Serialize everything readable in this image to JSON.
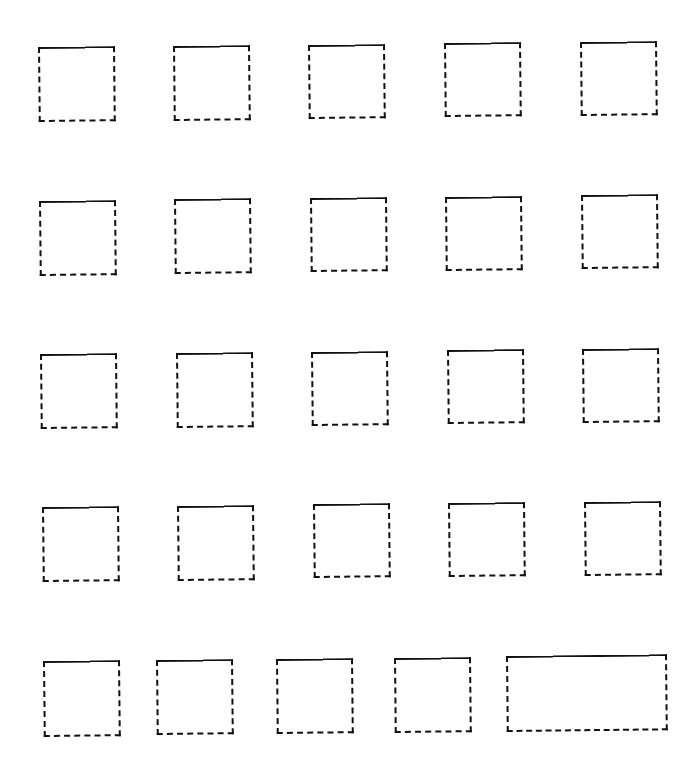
{
  "page": {
    "background": "#ffffff",
    "line_color": "#111111"
  },
  "boxes": [
    {
      "row": 1,
      "col": 1,
      "x": 38,
      "y": 47,
      "w": 77,
      "h": 75
    },
    {
      "row": 1,
      "col": 2,
      "x": 173,
      "y": 46,
      "w": 77,
      "h": 75
    },
    {
      "row": 1,
      "col": 3,
      "x": 308,
      "y": 45,
      "w": 77,
      "h": 74
    },
    {
      "row": 1,
      "col": 4,
      "x": 444,
      "y": 43,
      "w": 77,
      "h": 74
    },
    {
      "row": 1,
      "col": 5,
      "x": 580,
      "y": 42,
      "w": 77,
      "h": 74
    },
    {
      "row": 2,
      "col": 1,
      "x": 39,
      "y": 201,
      "w": 77,
      "h": 75
    },
    {
      "row": 2,
      "col": 2,
      "x": 174,
      "y": 199,
      "w": 77,
      "h": 75
    },
    {
      "row": 2,
      "col": 3,
      "x": 310,
      "y": 198,
      "w": 77,
      "h": 74
    },
    {
      "row": 2,
      "col": 4,
      "x": 445,
      "y": 197,
      "w": 77,
      "h": 74
    },
    {
      "row": 2,
      "col": 5,
      "x": 581,
      "y": 195,
      "w": 77,
      "h": 74
    },
    {
      "row": 3,
      "col": 1,
      "x": 40,
      "y": 354,
      "w": 77,
      "h": 75
    },
    {
      "row": 3,
      "col": 2,
      "x": 176,
      "y": 353,
      "w": 77,
      "h": 75
    },
    {
      "row": 3,
      "col": 3,
      "x": 311,
      "y": 352,
      "w": 77,
      "h": 74
    },
    {
      "row": 3,
      "col": 4,
      "x": 447,
      "y": 350,
      "w": 77,
      "h": 74
    },
    {
      "row": 3,
      "col": 5,
      "x": 582,
      "y": 349,
      "w": 77,
      "h": 74
    },
    {
      "row": 4,
      "col": 1,
      "x": 42,
      "y": 507,
      "w": 77,
      "h": 75
    },
    {
      "row": 4,
      "col": 2,
      "x": 177,
      "y": 506,
      "w": 77,
      "h": 75
    },
    {
      "row": 4,
      "col": 3,
      "x": 313,
      "y": 504,
      "w": 77,
      "h": 74
    },
    {
      "row": 4,
      "col": 4,
      "x": 448,
      "y": 503,
      "w": 77,
      "h": 74
    },
    {
      "row": 4,
      "col": 5,
      "x": 584,
      "y": 502,
      "w": 77,
      "h": 74
    },
    {
      "row": 5,
      "col": 1,
      "x": 43,
      "y": 661,
      "w": 77,
      "h": 76
    },
    {
      "row": 5,
      "col": 2,
      "x": 156,
      "y": 660,
      "w": 77,
      "h": 75
    },
    {
      "row": 5,
      "col": 3,
      "x": 276,
      "y": 659,
      "w": 77,
      "h": 75
    },
    {
      "row": 5,
      "col": 4,
      "x": 394,
      "y": 658,
      "w": 77,
      "h": 75
    },
    {
      "row": 5,
      "col": 5,
      "x": 506,
      "y": 656,
      "w": 161,
      "h": 76
    }
  ]
}
